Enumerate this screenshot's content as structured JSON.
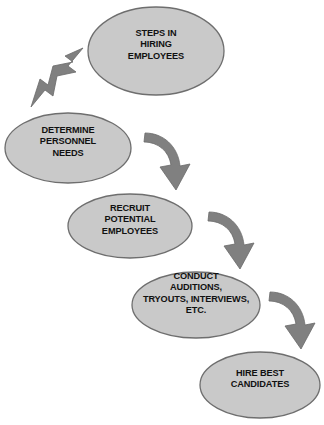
{
  "diagram": {
    "background_color": "#ffffff",
    "node_fill_color": "#c9c9c9",
    "node_stroke_color": "#6e6e6e",
    "arrow_color": "#808080",
    "text_color": "#111111",
    "nodes": [
      {
        "id": "node-steps-in-hiring-employees",
        "shape": "ellipse",
        "lines": [
          "STEPS IN",
          "HIRING",
          "EMPLOYEES"
        ],
        "text": "STEPS IN HIRING EMPLOYEES",
        "cx": 156,
        "cy": 51,
        "rx": 68,
        "ry": 44
      },
      {
        "id": "node-determine-personnel-needs",
        "shape": "ellipse",
        "lines": [
          "DETERMINE",
          "PERSONNEL",
          "NEEDS"
        ],
        "text": "DETERMINE PERSONNEL NEEDS",
        "cx": 68,
        "cy": 148,
        "rx": 63,
        "ry": 35
      },
      {
        "id": "node-recruit-potential-employees",
        "shape": "ellipse",
        "lines": [
          "RECRUIT",
          "POTENTIAL",
          "EMPLOYEES"
        ],
        "text": "RECRUIT POTENTIAL EMPLOYEES",
        "cx": 130,
        "cy": 226,
        "rx": 62,
        "ry": 32
      },
      {
        "id": "node-conduct-auditions",
        "shape": "ellipse",
        "lines": [
          "CONDUCT",
          "AUDITIONS,",
          "TRYOUTS, INTERVIEWS,",
          "ETC."
        ],
        "text": "CONDUCT AUDITIONS, TRYOUTS, INTERVIEWS, ETC.",
        "cx": 196,
        "cy": 305,
        "rx": 64,
        "ry": 33
      },
      {
        "id": "node-hire-best-candidates",
        "shape": "ellipse",
        "lines": [
          "HIRE BEST",
          "CANDIDATES"
        ],
        "text": "HIRE BEST CANDIDATES",
        "cx": 260,
        "cy": 385,
        "rx": 60,
        "ry": 33
      }
    ],
    "arrows": [
      {
        "id": "arrow-1",
        "style": "straight-block",
        "direction": "down-left",
        "from": "node-steps-in-hiring-employees",
        "to": "node-determine-personnel-needs"
      },
      {
        "id": "arrow-2",
        "style": "curved-block",
        "direction": "down-right-curve",
        "from": "node-determine-personnel-needs",
        "to": "node-recruit-potential-employees"
      },
      {
        "id": "arrow-3",
        "style": "curved-block",
        "direction": "down-right-curve",
        "from": "node-recruit-potential-employees",
        "to": "node-conduct-auditions"
      },
      {
        "id": "arrow-4",
        "style": "curved-block",
        "direction": "down-right-curve",
        "from": "node-conduct-auditions",
        "to": "node-hire-best-candidates"
      }
    ]
  }
}
